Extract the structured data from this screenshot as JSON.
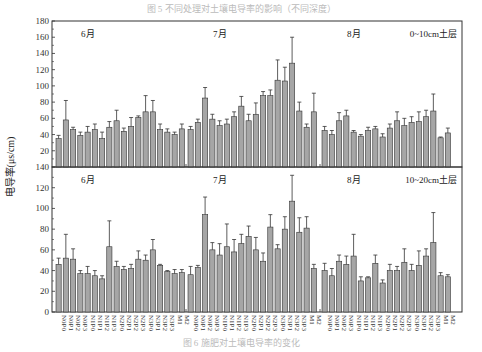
{
  "caption_top": "图 5  不同处理对土壤电导率的影响（不同深度）",
  "caption_bottom": "图 6  施肥对土壤电导率的变化",
  "chart_data": {
    "type": "bar",
    "ylabel": "电导率(μs/cm)",
    "categories": [
      "N0P0",
      "N0P1",
      "N0P2",
      "N0P3",
      "N1P0",
      "N1P1",
      "N1P2",
      "N1P3",
      "N2P0",
      "N2P1",
      "N2P2",
      "N2P3",
      "N3P0",
      "N3P1",
      "N3P2",
      "N3P3",
      "M1",
      "M2"
    ],
    "months": [
      "6月",
      "7月",
      "8月"
    ],
    "panels": [
      {
        "name": "0~10cm土层",
        "ylim": [
          0,
          180
        ],
        "yticks": [
          20,
          40,
          60,
          80,
          100,
          120,
          140,
          160,
          180
        ],
        "series": [
          {
            "name": "6月",
            "values": [
              35,
              58,
              46,
              39,
              43,
              46,
              35,
              49,
              57,
              44,
              50,
              61,
              68,
              68,
              46,
              43,
              40,
              47
            ],
            "errors": [
              4,
              24,
              3,
              4,
              7,
              7,
              8,
              7,
              13,
              4,
              11,
              2,
              20,
              14,
              7,
              4,
              3,
              6
            ]
          },
          {
            "name": "7月",
            "values": [
              46,
              55,
              85,
              59,
              51,
              53,
              62,
              75,
              57,
              65,
              88,
              88,
              107,
              106,
              128,
              69,
              49,
              68
            ],
            "errors": [
              4,
              4,
              13,
              6,
              6,
              6,
              6,
              12,
              8,
              14,
              5,
              7,
              25,
              17,
              32,
              11,
              4,
              23
            ]
          },
          {
            "name": "8月",
            "values": [
              45,
              40,
              57,
              63,
              43,
              38,
              45,
              47,
              37,
              48,
              57,
              51,
              55,
              56,
              62,
              69,
              36,
              42
            ],
            "errors": [
              5,
              5,
              10,
              7,
              2,
              2,
              4,
              3,
              4,
              5,
              11,
              9,
              7,
              12,
              8,
              21,
              1,
              6
            ]
          }
        ]
      },
      {
        "name": "10~20cm土层",
        "ylim": [
          0,
          140
        ],
        "yticks": [
          0,
          20,
          40,
          60,
          80,
          100,
          120,
          140
        ],
        "series": [
          {
            "name": "6月",
            "values": [
              46,
              52,
              51,
              37,
              37,
              35,
              32,
              63,
              44,
              41,
              42,
              51,
              50,
              60,
              45,
              39,
              37,
              38
            ],
            "errors": [
              6,
              23,
              10,
              3,
              7,
              5,
              3,
              25,
              5,
              3,
              4,
              8,
              5,
              10,
              1,
              1,
              4,
              3
            ]
          },
          {
            "name": "7月",
            "values": [
              36,
              43,
              94,
              60,
              55,
              63,
              58,
              66,
              73,
              60,
              49,
              82,
              61,
              80,
              107,
              77,
              81,
              42
            ],
            "errors": [
              8,
              2,
              17,
              7,
              11,
              22,
              12,
              9,
              10,
              12,
              8,
              12,
              4,
              12,
              25,
              14,
              11,
              4
            ]
          },
          {
            "name": "8月",
            "values": [
              40,
              35,
              49,
              46,
              54,
              30,
              33,
              47,
              28,
              40,
              40,
              48,
              40,
              45,
              54,
              67,
              35,
              34
            ],
            "errors": [
              7,
              7,
              6,
              8,
              21,
              4,
              1,
              8,
              3,
              6,
              4,
              13,
              6,
              14,
              7,
              29,
              3,
              2
            ]
          }
        ]
      }
    ]
  }
}
